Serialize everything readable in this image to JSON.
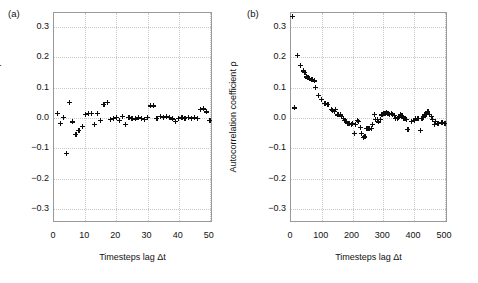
{
  "figure": {
    "panels": [
      {
        "label": "(a)",
        "xlabel": "Timesteps lag Δt",
        "ylabel": "Autocorrelation coefficient ρ",
        "xticks": [
          "0",
          "10",
          "20",
          "30",
          "40",
          "50"
        ],
        "yticks": [
          "0.3",
          "0.2",
          "0.1",
          "0.0",
          "−0.1",
          "−0.2",
          "−0.3"
        ]
      },
      {
        "label": "(b)",
        "xlabel": "Timesteps lag Δt",
        "ylabel": "Autocorrelation coefficient ρ",
        "xticks": [
          "0",
          "100",
          "200",
          "300",
          "400",
          "500"
        ],
        "yticks": [
          "0.3",
          "0.2",
          "0.1",
          "0.0",
          "−0.1",
          "−0.2",
          "−0.3"
        ]
      }
    ]
  },
  "chart_data": [
    {
      "type": "scatter",
      "title": "(a)",
      "xlabel": "Timesteps lag Δt",
      "ylabel": "Autocorrelation coefficient ρ",
      "xlim": [
        0,
        51
      ],
      "ylim": [
        -0.345,
        0.345
      ],
      "xticks": [
        0,
        10,
        20,
        30,
        40,
        50
      ],
      "yticks": [
        0.3,
        0.2,
        0.1,
        0.0,
        -0.1,
        -0.2,
        -0.3
      ],
      "grid": true,
      "legend": null,
      "marker": "plus",
      "x": [
        1,
        2,
        3,
        4,
        5,
        6,
        7,
        8,
        9,
        10,
        11,
        12,
        13,
        14,
        15,
        16,
        17,
        18,
        19,
        20,
        21,
        22,
        23,
        24,
        25,
        26,
        27,
        28,
        29,
        30,
        31,
        32,
        33,
        34,
        35,
        36,
        37,
        38,
        39,
        40,
        41,
        42,
        43,
        44,
        45,
        46,
        47,
        48,
        49,
        50
      ],
      "y": [
        0.016,
        -0.018,
        0.002,
        -0.115,
        0.051,
        -0.013,
        -0.055,
        -0.042,
        -0.027,
        0.013,
        0.015,
        0.015,
        -0.02,
        0.016,
        -0.007,
        0.046,
        0.051,
        -0.004,
        -0.002,
        0.001,
        -0.007,
        0.006,
        -0.02,
        0.001,
        0.0,
        -0.003,
        0.003,
        0.0,
        -0.004,
        0.001,
        0.04,
        0.04,
        -0.002,
        0.004,
        0.003,
        0.006,
        0.003,
        -0.003,
        -0.012,
        0.0,
        0.002,
        0.0,
        0.001,
        0.0,
        0.001,
        0.0,
        0.028,
        0.03,
        0.02,
        -0.009
      ]
    },
    {
      "type": "scatter",
      "title": "(b)",
      "xlabel": "Timesteps lag Δt",
      "ylabel": "Autocorrelation coefficient ρ",
      "xlim": [
        0,
        510
      ],
      "ylim": [
        -0.345,
        0.345
      ],
      "xticks": [
        0,
        100,
        200,
        300,
        400,
        500
      ],
      "yticks": [
        0.3,
        0.2,
        0.1,
        0.0,
        -0.1,
        -0.2,
        -0.3
      ],
      "grid": true,
      "legend": null,
      "marker": "plus",
      "x": [
        5,
        10,
        20,
        30,
        40,
        45,
        50,
        55,
        60,
        65,
        70,
        75,
        80,
        90,
        100,
        110,
        120,
        130,
        135,
        140,
        145,
        150,
        155,
        160,
        165,
        170,
        175,
        180,
        185,
        190,
        195,
        200,
        205,
        210,
        215,
        220,
        225,
        230,
        235,
        240,
        245,
        250,
        255,
        260,
        265,
        270,
        275,
        280,
        285,
        290,
        295,
        300,
        305,
        310,
        315,
        320,
        325,
        330,
        335,
        340,
        345,
        350,
        355,
        360,
        365,
        370,
        375,
        380,
        390,
        400,
        405,
        410,
        415,
        420,
        425,
        430,
        435,
        440,
        445,
        450,
        455,
        460,
        465,
        470,
        475,
        480,
        490,
        500
      ],
      "y": [
        0.335,
        0.033,
        0.205,
        0.173,
        0.155,
        0.15,
        0.135,
        0.132,
        0.13,
        0.128,
        0.125,
        0.122,
        0.1,
        0.073,
        0.06,
        0.047,
        0.046,
        0.028,
        0.026,
        0.022,
        0.028,
        0.01,
        0.012,
        0.01,
        0.005,
        0.0,
        -0.008,
        -0.012,
        -0.018,
        -0.019,
        -0.02,
        -0.019,
        -0.05,
        -0.02,
        -0.008,
        -0.01,
        -0.03,
        -0.05,
        -0.063,
        -0.062,
        -0.035,
        -0.034,
        -0.036,
        -0.034,
        -0.02,
        0.012,
        -0.005,
        -0.004,
        -0.013,
        -0.004,
        0.01,
        0.015,
        0.014,
        0.017,
        0.016,
        0.013,
        0.015,
        0.013,
        0.008,
        0.0,
        -0.002,
        0.003,
        0.01,
        0.007,
        -0.001,
        0.0,
        -0.005,
        -0.037,
        -0.01,
        -0.007,
        -0.003,
        -0.002,
        0.0,
        -0.041,
        -0.002,
        0.002,
        0.01,
        0.012,
        0.023,
        0.012,
        0.004,
        -0.005,
        -0.022,
        -0.01,
        -0.017,
        -0.019,
        -0.014,
        -0.017
      ]
    }
  ],
  "caption": {
    "text": ""
  }
}
